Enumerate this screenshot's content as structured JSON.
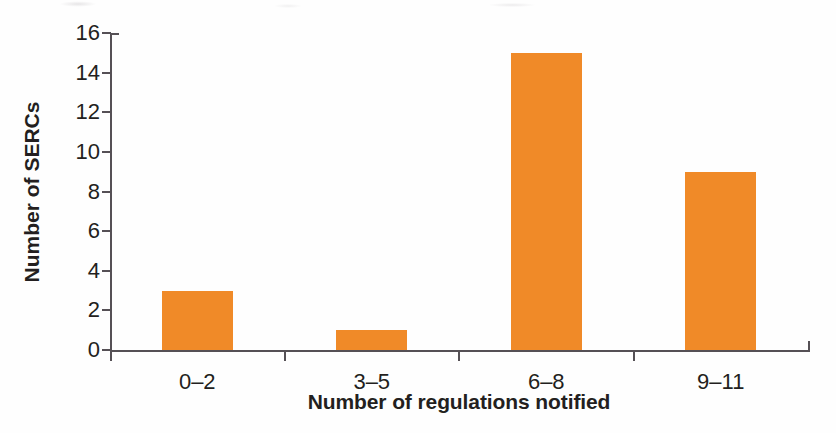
{
  "chart_data": {
    "type": "bar",
    "title": "",
    "subtitle": "",
    "xlabel": "Number of regulations notified",
    "ylabel": "Number of SERCs",
    "categories": [
      "0–2",
      "3–5",
      "6–8",
      "9–11"
    ],
    "values": [
      3,
      1,
      15,
      9
    ],
    "series": [
      {
        "name": "Number of SERCs",
        "values": [
          3,
          1,
          15,
          9
        ]
      }
    ],
    "ylim": [
      0,
      16
    ],
    "yticks": [
      0,
      2,
      4,
      6,
      8,
      10,
      12,
      14,
      16
    ],
    "ytick_labels": [
      "0",
      "2",
      "4",
      "6",
      "8",
      "10",
      "12",
      "14",
      "16"
    ],
    "grid": false,
    "legend": false,
    "legend_position": "none",
    "bar_color": "#f08a28",
    "axis_color": "#555055",
    "text_color": "#231f20",
    "background_color": "#ffffff",
    "annotations": []
  }
}
